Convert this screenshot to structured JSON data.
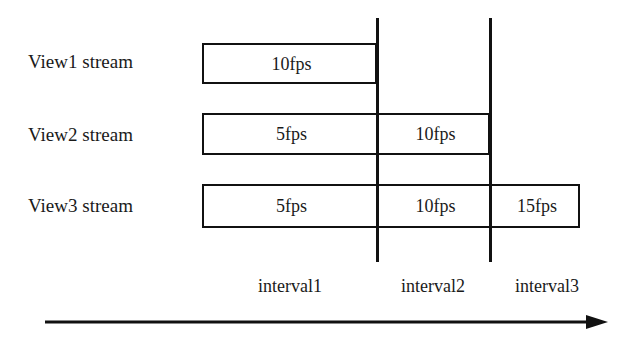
{
  "diagram": {
    "background_color": "#ffffff",
    "line_color": "#111111",
    "text_color": "#1a1a1a"
  },
  "rows": [
    {
      "label": "View1 stream",
      "label_top": 52,
      "bar": {
        "left": 202,
        "top": 43,
        "height": 41
      },
      "segments": [
        {
          "value": "10fps",
          "start": 202,
          "end": 377
        }
      ]
    },
    {
      "label": "View2 stream",
      "label_top": 125,
      "bar": {
        "left": 202,
        "top": 113,
        "height": 42
      },
      "segments": [
        {
          "value": "5fps",
          "start": 202,
          "end": 377
        },
        {
          "value": "10fps",
          "start": 377,
          "end": 490
        }
      ]
    },
    {
      "label": "View3 stream",
      "label_top": 196,
      "bar": {
        "left": 202,
        "top": 184,
        "height": 44
      },
      "segments": [
        {
          "value": "5fps",
          "start": 202,
          "end": 377
        },
        {
          "value": "10fps",
          "start": 377,
          "end": 490
        },
        {
          "value": "15fps",
          "start": 490,
          "end": 580
        }
      ]
    }
  ],
  "dividers": [
    {
      "x": 377,
      "top": 18,
      "bottom": 262
    },
    {
      "x": 490,
      "top": 18,
      "bottom": 262
    }
  ],
  "intervals": [
    {
      "label": "interval1",
      "center": 290,
      "top": 277
    },
    {
      "label": "interval2",
      "center": 433,
      "top": 277
    },
    {
      "label": "interval3",
      "center": 547,
      "top": 277
    }
  ],
  "axis": {
    "name": "time-axis",
    "direction": "right",
    "start_x": 45,
    "end_x": 608,
    "y": 322
  },
  "chart_data": {
    "type": "bar",
    "xlabel": "time",
    "ylabel": "",
    "categories": [
      "interval1",
      "interval2",
      "interval3"
    ],
    "series": [
      {
        "name": "View1 stream",
        "values": [
          "10fps",
          null,
          null
        ]
      },
      {
        "name": "View2 stream",
        "values": [
          "5fps",
          "10fps",
          null
        ]
      },
      {
        "name": "View3 stream",
        "values": [
          "5fps",
          "10fps",
          "15fps"
        ]
      }
    ],
    "grid": false,
    "legend": "none"
  }
}
